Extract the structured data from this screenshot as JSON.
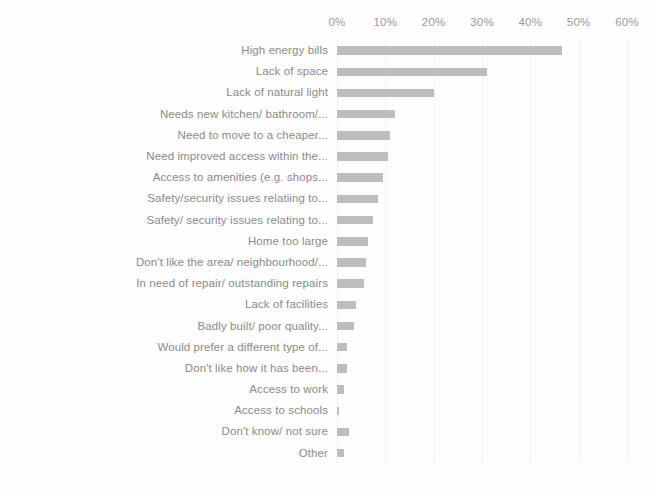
{
  "chart_data": {
    "type": "bar",
    "orientation": "horizontal",
    "title": "",
    "subtitle": "",
    "xlabel": "",
    "ylabel": "",
    "xlim": [
      0,
      60
    ],
    "grid": true,
    "legend": null,
    "bar_color": "#bdbdbd",
    "axis_text_color": "#9a9a9a",
    "tick_labels": [
      "0%",
      "10%",
      "20%",
      "30%",
      "40%",
      "50%",
      "60%"
    ],
    "tick_values": [
      0,
      10,
      20,
      30,
      40,
      50,
      60
    ],
    "categories": [
      "High energy bills",
      "Lack of space",
      "Lack of natural light",
      "Needs new kitchen/ bathroom/...",
      "Need to move to a cheaper...",
      "Need improved access within the...",
      "Access to amenities (e.g. shops...",
      "Safety/security issues relatiing to...",
      "Safety/ security issues relating to...",
      "Home too large",
      "Don't like the area/ neighbourhood/...",
      "In need of repair/ outstanding repairs",
      "Lack of facilities",
      "Badly built/ poor quality...",
      "Would prefer a different type of...",
      "Don't like how it has been...",
      "Access to work",
      "Access to schools",
      "Don't know/ not sure",
      "Other"
    ],
    "values": [
      46.5,
      31.0,
      20.0,
      12.0,
      11.0,
      10.5,
      9.5,
      8.5,
      7.5,
      6.5,
      6.0,
      5.5,
      4.0,
      3.5,
      2.0,
      2.0,
      1.5,
      0.5,
      2.5,
      1.5
    ]
  }
}
